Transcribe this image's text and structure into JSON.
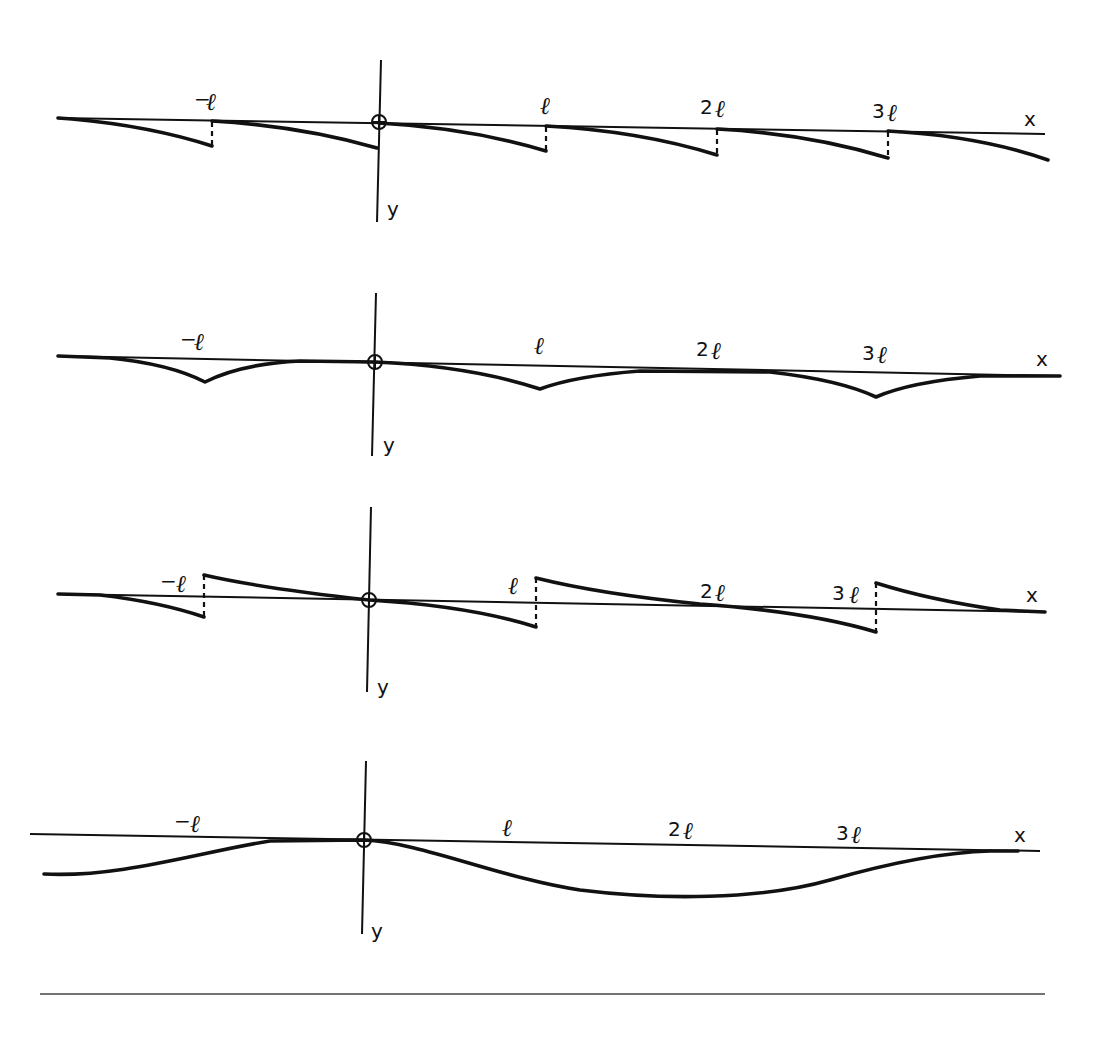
{
  "figure": {
    "axis_labels": {
      "x": "x",
      "y": "y"
    },
    "tick_labels": [
      "-l",
      "l",
      "2l",
      "3l"
    ],
    "tick_label_display": [
      "−ℓ",
      "ℓ",
      "2ℓ",
      "3ℓ"
    ],
    "ink_color": "#111111",
    "background": "#ffffff"
  },
  "panels": [
    {
      "id": "panel-1",
      "shape": "sawtooth",
      "description": "Curve drops gradually below the axis over each period and jumps back to the axis at x = -l, 0, l, 2l, 3l (dashed jump lines)",
      "discontinuities_at": [
        -1,
        0,
        1,
        2,
        3
      ],
      "continuous": false
    },
    {
      "id": "panel-2",
      "shape": "scalloped",
      "description": "Continuous curve with cusps (kinks) below the axis at x = -l, l, 3l; touches axis between kinks",
      "cusps_at": [
        -1,
        1,
        3
      ],
      "continuous": true
    },
    {
      "id": "panel-3",
      "shape": "odd-sawtooth",
      "description": "Curve passes through axis mid-period, rises above the axis just after each jump and falls below before it; jumps at x = -l, l, 3l",
      "discontinuities_at": [
        -1,
        1,
        3
      ],
      "continuous": false
    },
    {
      "id": "panel-4",
      "shape": "smooth-wave",
      "description": "Smooth wave tangent to the axis at the origin and near x = 3.7l, reaching its maximum depth near x = 2l",
      "continuous": true
    }
  ]
}
